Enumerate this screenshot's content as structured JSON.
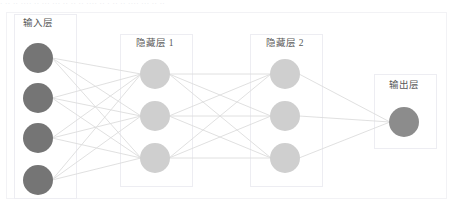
{
  "canvas": {
    "width": 452,
    "height": 217,
    "background": "#ffffff"
  },
  "top_strip": {
    "line1": "· ·· ·· ···· ·· ··· ··· ·· ·· ·· ···· ·· · ·· ·· ···· ··· ·· ··",
    "line2": "·· ··· ····· ··"
  },
  "chart_data": {
    "type": "diagram",
    "title": "",
    "diagram_kind": "feedforward-neural-network",
    "fully_connected": true,
    "outer_box": {
      "x": 6,
      "y": 12,
      "width": 440,
      "height": 186,
      "stroke": "#f2f2f5",
      "fill": "#ffffff"
    },
    "colors": {
      "input_node": "#757575",
      "hidden_node": "#cfcfcf",
      "output_node": "#8c8c8c",
      "edge": "#dddddd",
      "group_box_border": "#ededf2",
      "label_text": "#595959"
    },
    "layers": [
      {
        "id": "input",
        "label": "输入层",
        "node_count": 4,
        "node_color": "#757575",
        "node_radius": 15,
        "center_x": 38,
        "node_y": [
          58,
          98,
          138,
          180
        ],
        "label_x": 38,
        "label_y": 22,
        "box": {
          "x": 14,
          "y": 14,
          "width": 62,
          "height": 184
        }
      },
      {
        "id": "hidden1",
        "label": "隐藏层 1",
        "node_count": 3,
        "node_color": "#cfcfcf",
        "node_radius": 15,
        "center_x": 155,
        "node_y": [
          74,
          116,
          158
        ],
        "label_x": 155,
        "label_y": 42,
        "box": {
          "x": 120,
          "y": 34,
          "width": 72,
          "height": 152
        }
      },
      {
        "id": "hidden2",
        "label": "隐藏层 2",
        "node_count": 3,
        "node_color": "#cfcfcf",
        "node_radius": 15,
        "center_x": 285,
        "node_y": [
          74,
          116,
          158
        ],
        "label_x": 285,
        "label_y": 42,
        "box": {
          "x": 250,
          "y": 34,
          "width": 72,
          "height": 152
        }
      },
      {
        "id": "output",
        "label": "输出层",
        "node_count": 1,
        "node_color": "#8c8c8c",
        "node_radius": 15,
        "center_x": 404,
        "node_y": [
          122
        ],
        "label_x": 404,
        "label_y": 84,
        "box": {
          "x": 374,
          "y": 74,
          "width": 62,
          "height": 74
        }
      }
    ],
    "connections": [
      {
        "from": "input",
        "to": "hidden1",
        "count": 12
      },
      {
        "from": "hidden1",
        "to": "hidden2",
        "count": 9
      },
      {
        "from": "hidden2",
        "to": "output",
        "count": 3
      }
    ]
  }
}
